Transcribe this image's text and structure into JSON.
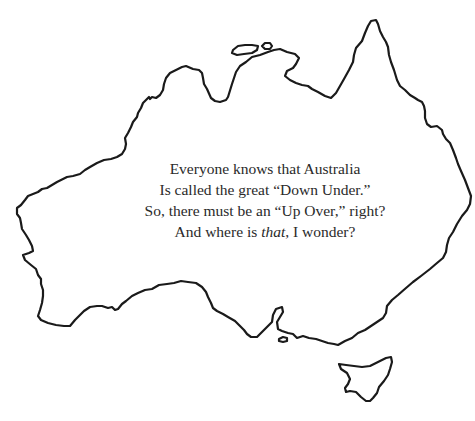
{
  "illustration": {
    "subject": "Australia outline map with Tasmania",
    "stroke_color": "#1a1a1a",
    "background_color": "#ffffff"
  },
  "poem": {
    "lines": [
      "Everyone knows that Australia",
      "Is called the great “Down Under.”",
      "So, there must be an “Up Over,” right?"
    ],
    "last_line": {
      "before": "And where is ",
      "italic": "that",
      "after": ", I wonder?"
    },
    "text_color": "#2a2a2a"
  }
}
